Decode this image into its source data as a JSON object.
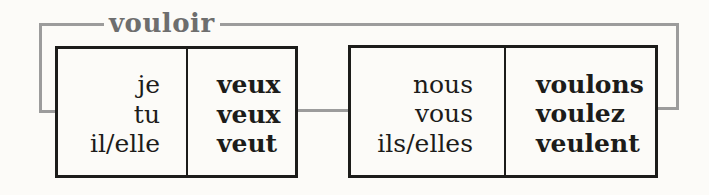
{
  "verb_label": "vouloir",
  "singular_table": {
    "rows": [
      {
        "pronoun": "je",
        "form": "veux"
      },
      {
        "pronoun": "tu",
        "form": "veux"
      },
      {
        "pronoun": "il/elle",
        "form": "veut"
      }
    ]
  },
  "plural_table": {
    "rows": [
      {
        "pronoun": "nous",
        "form": "voulons"
      },
      {
        "pronoun": "vous",
        "form": "voulez"
      },
      {
        "pronoun": "ils/elles",
        "form": "veulent"
      }
    ]
  },
  "colors": {
    "background": "#fcfbf8",
    "frame_gray": "#9c9c9c",
    "label_gray": "#6e6e6e",
    "text_black": "#1c1c1a"
  }
}
